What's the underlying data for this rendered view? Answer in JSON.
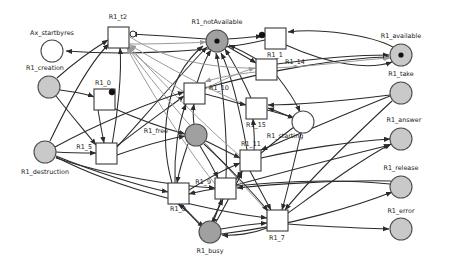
{
  "diagram": {
    "type": "petri-net",
    "title": "",
    "width": 449,
    "height": 267,
    "background": "#ffffff",
    "colors": {
      "place_stroke": "#4d4d4d",
      "place_fill_gray": "#c9c9c9",
      "place_fill_darkgray": "#a0a0a0",
      "place_fill_white": "#ffffff",
      "transition_fill": "#ffffff",
      "transition_stroke": "#3a3a3a",
      "arc": "#2b2b2b",
      "arc_light": "#9a9a9a",
      "token": "#111111",
      "label": "#1a1a1a"
    }
  },
  "places": [
    {
      "id": "Ax_startbyres",
      "label": "Ax_startbyres",
      "cx": 52,
      "cy": 51,
      "r": 11,
      "fill": "#ffffff",
      "tokens": 0,
      "label_x": 52,
      "label_y": 33,
      "anchor": "middle"
    },
    {
      "id": "R1_creation",
      "label": "R1_creation",
      "cx": 49,
      "cy": 87,
      "r": 11,
      "fill": "#c9c9c9",
      "tokens": 0,
      "label_x": 45,
      "label_y": 68,
      "anchor": "middle"
    },
    {
      "id": "R1_destruction",
      "label": "R1_destruction",
      "cx": 45,
      "cy": 152,
      "r": 11,
      "fill": "#c9c9c9",
      "tokens": 0,
      "label_x": 45,
      "label_y": 172,
      "anchor": "middle"
    },
    {
      "id": "R1_notAvailable",
      "label": "R1_notAvailable",
      "cx": 217,
      "cy": 41,
      "r": 11,
      "fill": "#a0a0a0",
      "tokens": 1,
      "label_x": 217,
      "label_y": 22,
      "anchor": "middle"
    },
    {
      "id": "R1_free",
      "label": "R1_free",
      "cx": 196,
      "cy": 135,
      "r": 11,
      "fill": "#a0a0a0",
      "tokens": 0,
      "label_x": 168,
      "label_y": 131,
      "anchor": "end"
    },
    {
      "id": "R1_starting",
      "label": "R1_starting",
      "cx": 303,
      "cy": 122,
      "r": 11,
      "fill": "#ffffff",
      "tokens": 0,
      "label_x": 285,
      "label_y": 136,
      "anchor": "middle"
    },
    {
      "id": "R1_busy",
      "label": "R1_busy",
      "cx": 210,
      "cy": 232,
      "r": 11,
      "fill": "#a0a0a0",
      "tokens": 0,
      "label_x": 210,
      "label_y": 251,
      "anchor": "middle"
    },
    {
      "id": "R1_available",
      "label": "R1_available",
      "cx": 401,
      "cy": 55,
      "r": 11,
      "fill": "#c9c9c9",
      "tokens": 1,
      "label_x": 401,
      "label_y": 36,
      "anchor": "middle"
    },
    {
      "id": "R1_take",
      "label": "R1_take",
      "cx": 401,
      "cy": 93,
      "r": 11,
      "fill": "#c9c9c9",
      "tokens": 0,
      "label_x": 401,
      "label_y": 74,
      "anchor": "middle"
    },
    {
      "id": "R1_answer",
      "label": "R1_answer",
      "cx": 401,
      "cy": 139,
      "r": 11,
      "fill": "#c9c9c9",
      "tokens": 0,
      "label_x": 404,
      "label_y": 120,
      "anchor": "middle"
    },
    {
      "id": "R1_release",
      "label": "R1_release",
      "cx": 401,
      "cy": 187,
      "r": 11,
      "fill": "#c9c9c9",
      "tokens": 0,
      "label_x": 401,
      "label_y": 168,
      "anchor": "middle"
    },
    {
      "id": "R1_error",
      "label": "R1_error",
      "cx": 401,
      "cy": 229,
      "r": 11,
      "fill": "#c9c9c9",
      "tokens": 0,
      "label_x": 401,
      "label_y": 211,
      "anchor": "middle"
    }
  ],
  "transitions": [
    {
      "id": "R1_t2",
      "label": "R1_t2",
      "x": 108,
      "y": 27,
      "w": 21,
      "h": 21,
      "label_x": 118,
      "label_y": 17,
      "anchor": "middle",
      "marker": "inhibitor-right",
      "marker_x": 133,
      "marker_y": 34
    },
    {
      "id": "R1_1",
      "label": "R1_1",
      "x": 265,
      "y": 28,
      "w": 21,
      "h": 21,
      "label_x": 275,
      "label_y": 55,
      "anchor": "middle",
      "marker": "dot-left",
      "marker_x": 262,
      "marker_y": 35
    },
    {
      "id": "R1_0",
      "label": "R1_0",
      "x": 94,
      "y": 89,
      "w": 21,
      "h": 21,
      "label_x": 103,
      "label_y": 83,
      "anchor": "middle",
      "marker": "dot-corner",
      "marker_x": 112,
      "marker_y": 92
    },
    {
      "id": "R1_14",
      "label": "R1_14",
      "x": 256,
      "y": 59,
      "w": 21,
      "h": 21,
      "label_x": 285,
      "label_y": 62,
      "anchor": "start",
      "marker": "none",
      "marker_x": 0,
      "marker_y": 0
    },
    {
      "id": "R1_10",
      "label": "R1_10",
      "x": 184,
      "y": 83,
      "w": 21,
      "h": 21,
      "label_x": 209,
      "label_y": 88,
      "anchor": "start",
      "marker": "none",
      "marker_x": 0,
      "marker_y": 0
    },
    {
      "id": "R1_15",
      "label": "R1_15",
      "x": 246,
      "y": 98,
      "w": 21,
      "h": 21,
      "label_x": 256,
      "label_y": 125,
      "anchor": "middle",
      "marker": "none",
      "marker_x": 0,
      "marker_y": 0
    },
    {
      "id": "R1_5",
      "label": "R1_5",
      "x": 96,
      "y": 143,
      "w": 21,
      "h": 21,
      "label_x": 92,
      "label_y": 147,
      "anchor": "end",
      "marker": "none",
      "marker_x": 0,
      "marker_y": 0
    },
    {
      "id": "R1_11",
      "label": "R1_11",
      "x": 240,
      "y": 150,
      "w": 21,
      "h": 21,
      "label_x": 251,
      "label_y": 144,
      "anchor": "middle",
      "marker": "none",
      "marker_x": 0,
      "marker_y": 0
    },
    {
      "id": "R1_9",
      "label": "R1_9",
      "x": 215,
      "y": 178,
      "w": 21,
      "h": 21,
      "label_x": 211,
      "label_y": 182,
      "anchor": "end",
      "marker": "none",
      "marker_x": 0,
      "marker_y": 0
    },
    {
      "id": "R1_8",
      "label": "R1_8",
      "x": 168,
      "y": 183,
      "w": 21,
      "h": 21,
      "label_x": 178,
      "label_y": 209,
      "anchor": "middle",
      "marker": "none",
      "marker_x": 0,
      "marker_y": 0
    },
    {
      "id": "R1_7",
      "label": "R1_7",
      "x": 267,
      "y": 210,
      "w": 21,
      "h": 21,
      "label_x": 277,
      "label_y": 238,
      "anchor": "middle",
      "marker": "none",
      "marker_x": 0,
      "marker_y": 0
    }
  ],
  "arcs": [
    {
      "from": "R1_1",
      "to": "Ax_startbyres",
      "style": "dark",
      "path": "M 265 40 C 210 53 120 55 66 51"
    },
    {
      "from": "R1_creation",
      "to": "R1_t2",
      "style": "dark",
      "path": "M 57 78 C 75 62 95 48 108 40"
    },
    {
      "from": "R1_creation",
      "to": "R1_0",
      "style": "dark",
      "path": "M 60 90 C 72 92 84 93 94 97"
    },
    {
      "from": "R1_creation",
      "to": "R1_5",
      "style": "dark",
      "path": "M 56 96 C 70 114 84 130 96 145"
    },
    {
      "from": "R1_destruction",
      "to": "R1_5",
      "style": "dark",
      "path": "M 56 152 C 70 153 83 153 96 153"
    },
    {
      "from": "R1_destruction",
      "to": "R1_t2",
      "style": "dark",
      "path": "M 50 141 C 66 108 88 64 109 44"
    },
    {
      "from": "R1_destruction",
      "to": "R1_8",
      "style": "dark",
      "path": "M 56 156 C 95 172 140 186 168 192"
    },
    {
      "from": "R1_destruction",
      "to": "R1_7",
      "style": "dark",
      "path": "M 56 157 C 120 190 210 211 267 218"
    },
    {
      "from": "R1_0",
      "to": "R1_5",
      "style": "dark",
      "path": "M 98 110 C 100 122 102 133 104 143"
    },
    {
      "from": "R1_0",
      "to": "R1_free",
      "style": "dark",
      "path": "M 113 108 C 140 120 170 130 185 134"
    },
    {
      "from": "R1_5",
      "to": "R1_t2",
      "style": "dark",
      "path": "M 112 145 C 118 112 122 72 120 48"
    },
    {
      "from": "R1_5",
      "to": "R1_10",
      "style": "dark",
      "path": "M 117 146 C 140 128 168 108 184 96"
    },
    {
      "from": "R1_5",
      "to": "R1_notAvailable",
      "style": "dark",
      "path": "M 117 147 C 150 110 190 64 207 47"
    },
    {
      "from": "R1_free",
      "to": "R1_10",
      "style": "dark",
      "path": "M 194 124 C 193 117 193 110 194 104"
    },
    {
      "from": "R1_free",
      "to": "R1_9",
      "style": "dark",
      "path": "M 200 146 C 207 157 213 168 218 178"
    },
    {
      "from": "R1_free",
      "to": "R1_11",
      "style": "dark",
      "path": "M 206 141 C 218 147 230 153 240 158"
    },
    {
      "from": "R1_free",
      "to": "R1_8",
      "style": "dark",
      "path": "M 188 144 C 183 158 179 172 177 183"
    },
    {
      "from": "R1_10",
      "to": "R1_notAvailable",
      "style": "dark",
      "path": "M 197 83 C 201 70 207 56 211 50"
    },
    {
      "from": "R1_busy",
      "to": "R1_8",
      "style": "dark",
      "path": "M 201 226 C 192 216 184 208 178 204"
    },
    {
      "from": "R1_busy",
      "to": "R1_9",
      "style": "dark",
      "path": "M 212 221 C 217 211 221 203 223 199"
    },
    {
      "from": "R1_busy",
      "to": "R1_7",
      "style": "dark",
      "path": "M 221 229 C 238 226 254 224 267 223"
    },
    {
      "from": "R1_7",
      "to": "R1_busy",
      "style": "dark",
      "path": "M 267 228 C 252 234 234 236 222 235"
    },
    {
      "from": "R1_8",
      "to": "R1_busy",
      "style": "dark",
      "path": "M 181 204 C 190 214 199 223 204 227"
    },
    {
      "from": "R1_9",
      "to": "R1_busy",
      "style": "dark",
      "path": "M 221 199 C 218 210 214 220 212 224"
    },
    {
      "from": "R1_8",
      "to": "R1_notAvailable",
      "style": "dark",
      "path": "M 172 183 C 160 140 162 80 203 46"
    },
    {
      "from": "R1_9",
      "to": "R1_notAvailable",
      "style": "dark",
      "path": "M 226 178 C 228 135 222 78 216 53"
    },
    {
      "from": "R1_11",
      "to": "R1_notAvailable",
      "style": "dark",
      "path": "M 247 150 C 240 110 230 70 221 53"
    },
    {
      "from": "R1_15",
      "to": "R1_notAvailable",
      "style": "dark",
      "path": "M 251 98 C 243 80 232 60 225 49"
    },
    {
      "from": "R1_14",
      "to": "R1_notAvailable",
      "style": "dark",
      "path": "M 258 60 C 248 54 236 48 229 45"
    },
    {
      "from": "R1_notAvailable",
      "to": "R1_14",
      "style": "dark",
      "path": "M 227 46 C 238 53 250 59 256 63"
    },
    {
      "from": "R1_notAvailable",
      "to": "R1_1",
      "style": "dark",
      "path": "M 228 39 C 240 38 253 37 262 36"
    },
    {
      "from": "R1_notAvailable",
      "to": "R1_t2",
      "style": "dark",
      "path": "M 206 39 C 180 37 150 35 131 34"
    },
    {
      "from": "R1_t2",
      "to": "R1_notAvailable",
      "style": "light",
      "path": "M 129 44 C 160 44 190 43 206 42"
    },
    {
      "from": "R1_15",
      "to": "R1_starting",
      "style": "dark",
      "path": "M 267 110 C 280 113 291 117 294 118"
    },
    {
      "from": "R1_14",
      "to": "R1_starting",
      "style": "dark",
      "path": "M 277 76 C 288 90 297 105 300 112"
    },
    {
      "from": "R1_starting",
      "to": "R1_15",
      "style": "dark",
      "path": "M 293 118 C 283 114 274 110 268 108"
    },
    {
      "from": "R1_starting",
      "to": "R1_7",
      "style": "dark",
      "path": "M 301 133 C 294 163 286 196 282 210"
    },
    {
      "from": "R1_11",
      "to": "R1_15",
      "style": "dark",
      "path": "M 254 150 C 255 140 254 130 253 119"
    },
    {
      "from": "R1_11",
      "to": "R1_answer",
      "style": "dark",
      "path": "M 261 158 C 300 149 355 141 390 139"
    },
    {
      "from": "R1_9",
      "to": "R1_answer",
      "style": "dark",
      "path": "M 236 185 C 280 173 345 156 390 145"
    },
    {
      "from": "R1_7",
      "to": "R1_answer",
      "style": "dark",
      "path": "M 288 213 C 320 190 360 160 391 144"
    },
    {
      "from": "R1_7",
      "to": "R1_error",
      "style": "dark",
      "path": "M 288 224 C 315 226 360 228 389 229"
    },
    {
      "from": "R1_release",
      "to": "R1_8",
      "style": "dark",
      "path": "M 390 184 C 310 176 220 186 189 194"
    },
    {
      "from": "R1_release",
      "to": "R1_9",
      "style": "dark",
      "path": "M 391 181 C 340 180 275 184 237 188"
    },
    {
      "from": "R1_take",
      "to": "R1_11",
      "style": "dark",
      "path": "M 390 96 C 340 116 285 140 261 150"
    },
    {
      "from": "R1_take",
      "to": "R1_15",
      "style": "dark",
      "path": "M 390 95 C 350 100 300 105 268 105"
    },
    {
      "from": "R1_available",
      "to": "R1_1",
      "style": "dark",
      "path": "M 393 47 C 370 35 320 28 288 32"
    },
    {
      "from": "R1_1",
      "to": "R1_available",
      "style": "dark",
      "path": "M 286 45 C 330 65 370 70 392 62"
    },
    {
      "from": "R1_14",
      "to": "R1_available",
      "style": "dark",
      "path": "M 277 64 C 320 58 365 55 389 55"
    },
    {
      "from": "R1_10",
      "to": "R1_available",
      "style": "dark",
      "path": "M 205 88 C 270 70 340 58 389 57"
    },
    {
      "from": "R1_t2",
      "to": "R1_available",
      "style": "light",
      "path": "M 130 37 C 210 88 320 62 390 58"
    },
    {
      "from": "R1_busy",
      "to": "R1_release",
      "style": "dark",
      "path": "M 221 234 C 290 226 360 205 392 192"
    },
    {
      "from": "R1_10",
      "to": "R1_t2",
      "style": "light",
      "path": "M 184 92 C 160 76 138 58 127 47"
    },
    {
      "from": "R1_15",
      "to": "R1_t2",
      "style": "light",
      "path": "M 246 105 C 205 88 158 62 130 45"
    },
    {
      "from": "R1_11",
      "to": "R1_t2",
      "style": "light",
      "path": "M 240 156 C 200 122 152 72 129 46"
    },
    {
      "from": "R1_9",
      "to": "R1_t2",
      "style": "light",
      "path": "M 215 184 C 180 140 143 78 127 48"
    },
    {
      "from": "R1_7",
      "to": "R1_t2",
      "style": "light",
      "path": "M 268 212 C 215 155 150 82 128 47"
    },
    {
      "from": "R1_14",
      "to": "R1_10",
      "style": "light",
      "path": "M 256 72 C 236 74 215 78 205 82"
    },
    {
      "from": "R1_10",
      "to": "R1_14",
      "style": "light",
      "path": "M 205 89 C 222 80 240 72 255 68"
    },
    {
      "from": "R1_8",
      "to": "R1_10",
      "style": "dark",
      "path": "M 175 183 C 174 155 178 124 186 104"
    },
    {
      "from": "R1_destruction",
      "to": "R1_10",
      "style": "dark",
      "path": "M 55 147 C 95 125 150 102 184 92"
    },
    {
      "from": "R1_5",
      "to": "R1_free",
      "style": "dark",
      "path": "M 117 155 C 140 147 168 139 185 136"
    },
    {
      "from": "R1_9",
      "to": "R1_11",
      "style": "dark",
      "path": "M 236 180 C 240 174 243 167 244 171"
    },
    {
      "from": "R1_11",
      "to": "R1_7",
      "style": "dark",
      "path": "M 250 171 C 258 186 266 201 271 210"
    },
    {
      "from": "R1_busy",
      "to": "R1_11",
      "style": "dark",
      "path": "M 216 222 C 226 204 236 186 242 172"
    },
    {
      "from": "R1_10",
      "to": "R1_15",
      "style": "dark",
      "path": "M 205 94 C 218 97 232 102 246 105"
    },
    {
      "from": "R1_starting",
      "to": "R1_9",
      "style": "dark",
      "path": "M 294 127 C 270 145 245 165 237 178"
    },
    {
      "from": "R1_take",
      "to": "R1_7",
      "style": "dark",
      "path": "M 392 101 C 350 140 305 185 285 210"
    },
    {
      "from": "R1_free",
      "to": "R1_7",
      "style": "dark",
      "path": "M 204 144 C 228 166 255 195 268 211"
    },
    {
      "from": "R1_8",
      "to": "R1_11",
      "style": "dark",
      "path": "M 189 190 C 205 180 223 170 240 163"
    },
    {
      "from": "R1_destruction",
      "to": "R1_9",
      "style": "dark",
      "path": "M 56 158 C 110 176 175 186 215 188"
    }
  ]
}
